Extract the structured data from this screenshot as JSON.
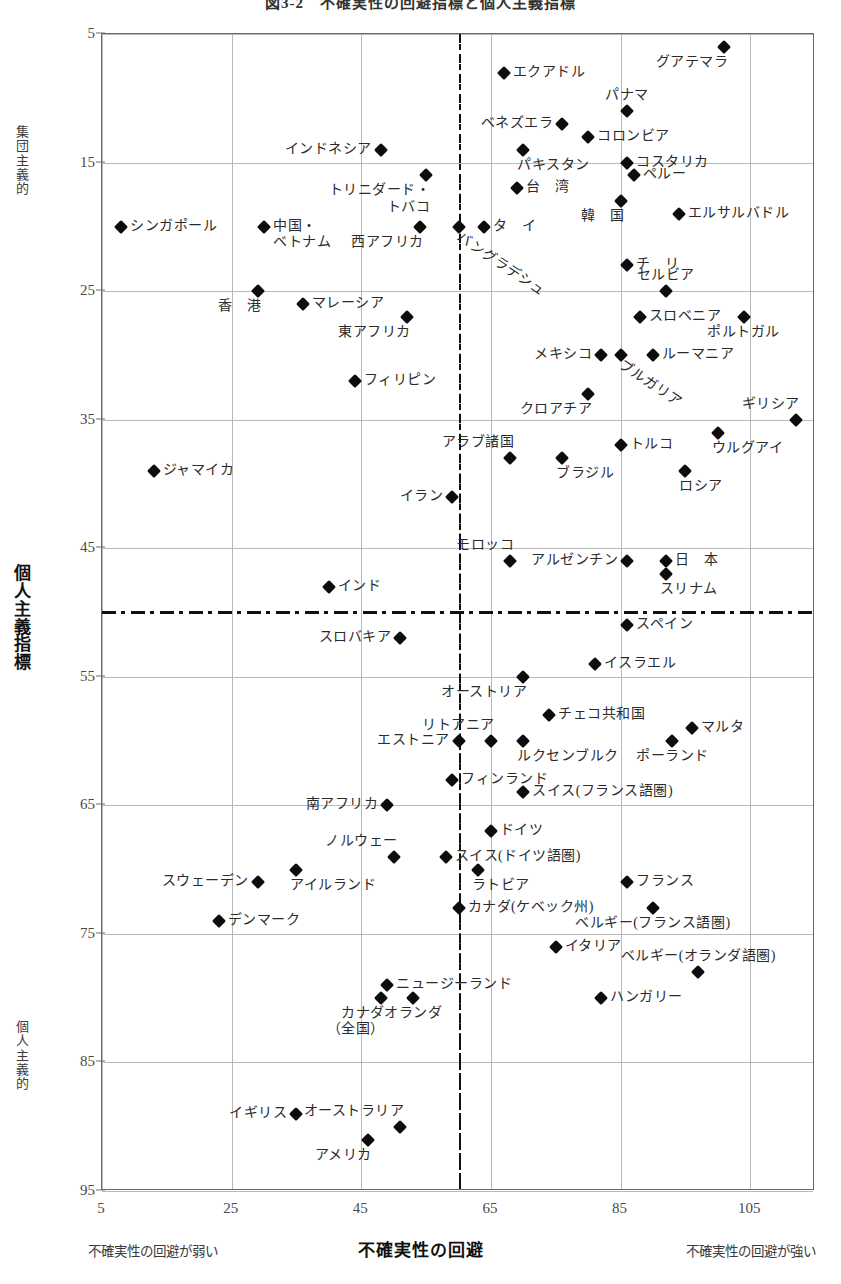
{
  "chart_data": {
    "type": "scatter",
    "title": "図3-2　不確実性の回避指標と個人主義指標",
    "xlabel": "不確実性の回避",
    "ylabel": "個人主義指標",
    "xlim": [
      5,
      115
    ],
    "ylim": [
      5,
      95
    ],
    "y_inverted": true,
    "grid": true,
    "legend": "none",
    "xticks": [
      5,
      25,
      45,
      65,
      85,
      105
    ],
    "yticks": [
      5,
      15,
      25,
      35,
      45,
      55,
      65,
      75,
      85,
      95
    ],
    "x_pole_low": "不確実性の回避が弱い",
    "x_pole_high": "不確実性の回避が強い",
    "y_pole_low": "集団主義的",
    "y_pole_high": "個人主義的",
    "reference_lines": {
      "x": 60,
      "y": 50
    },
    "marker_color": "#0d0d0d",
    "grid_color": "#b9b9b9",
    "frame_color": "#6a6a6a",
    "points": [
      {
        "label": "グアテマラ",
        "x": 101,
        "y": 6,
        "pos": "bl"
      },
      {
        "label": "エクアドル",
        "x": 67,
        "y": 8,
        "pos": "r"
      },
      {
        "label": "パナマ",
        "x": 86,
        "y": 11,
        "pos": "tc"
      },
      {
        "label": "ベネズエラ",
        "x": 76,
        "y": 12,
        "pos": "l"
      },
      {
        "label": "コロンビア",
        "x": 80,
        "y": 13,
        "pos": "r"
      },
      {
        "label": "インドネシア",
        "x": 48,
        "y": 14,
        "pos": "l"
      },
      {
        "label": "パキスタン",
        "x": 70,
        "y": 14,
        "pos": "b"
      },
      {
        "label": "コスタリカ",
        "x": 86,
        "y": 15,
        "pos": "r"
      },
      {
        "label": "ペルー",
        "x": 87,
        "y": 16,
        "pos": "r"
      },
      {
        "label": "トリニダード・\nトバコ",
        "x": 55,
        "y": 16,
        "pos": "bl"
      },
      {
        "label": "台　湾",
        "x": 69,
        "y": 17,
        "pos": "r"
      },
      {
        "label": "韓　国",
        "x": 85,
        "y": 18,
        "pos": "bl"
      },
      {
        "label": "エルサルバドル",
        "x": 94,
        "y": 19,
        "pos": "r"
      },
      {
        "label": "シンガポール",
        "x": 8,
        "y": 20,
        "pos": "r"
      },
      {
        "label": "中国・\nベトナム",
        "x": 30,
        "y": 20,
        "pos": "r"
      },
      {
        "label": "西アフリカ",
        "x": 54,
        "y": 20,
        "pos": "bl"
      },
      {
        "label": "バングラデシュ",
        "x": 60,
        "y": 20,
        "pos": "rot"
      },
      {
        "label": "タ　イ",
        "x": 64,
        "y": 20,
        "pos": "r"
      },
      {
        "label": "チ　リ",
        "x": 86,
        "y": 23,
        "pos": "r"
      },
      {
        "label": "香　港",
        "x": 29,
        "y": 25,
        "pos": "bl"
      },
      {
        "label": "セルビア",
        "x": 92,
        "y": 25,
        "pos": "tc"
      },
      {
        "label": "マレーシア",
        "x": 36,
        "y": 26,
        "pos": "r"
      },
      {
        "label": "スロベニア",
        "x": 88,
        "y": 27,
        "pos": "r"
      },
      {
        "label": "ポルトガル",
        "x": 104,
        "y": 27,
        "pos": "bc"
      },
      {
        "label": "東アフリカ",
        "x": 52,
        "y": 27,
        "pos": "bl"
      },
      {
        "label": "メキシコ",
        "x": 82,
        "y": 30,
        "pos": "l"
      },
      {
        "label": "ブルガリア",
        "x": 85,
        "y": 30,
        "pos": "rot"
      },
      {
        "label": "ルーマニア",
        "x": 90,
        "y": 30,
        "pos": "r"
      },
      {
        "label": "フィリピン",
        "x": 44,
        "y": 32,
        "pos": "r"
      },
      {
        "label": "クロアチア",
        "x": 80,
        "y": 33,
        "pos": "bl"
      },
      {
        "label": "ギリシア",
        "x": 112,
        "y": 35,
        "pos": "tl"
      },
      {
        "label": "トルコ",
        "x": 85,
        "y": 37,
        "pos": "r"
      },
      {
        "label": "ウルグアイ",
        "x": 100,
        "y": 36,
        "pos": "b"
      },
      {
        "label": "アラブ諸国",
        "x": 68,
        "y": 38,
        "pos": "tl"
      },
      {
        "label": "ブラジル",
        "x": 76,
        "y": 38,
        "pos": "b"
      },
      {
        "label": "ロシア",
        "x": 95,
        "y": 39,
        "pos": "b"
      },
      {
        "label": "ジャマイカ",
        "x": 13,
        "y": 39,
        "pos": "r"
      },
      {
        "label": "イラン",
        "x": 59,
        "y": 41,
        "pos": "l"
      },
      {
        "label": "モロッコ",
        "x": 68,
        "y": 46,
        "pos": "tl"
      },
      {
        "label": "アルゼンチン",
        "x": 86,
        "y": 46,
        "pos": "l"
      },
      {
        "label": "日　本",
        "x": 92,
        "y": 46,
        "pos": "r"
      },
      {
        "label": "スリナム",
        "x": 92,
        "y": 47,
        "pos": "b"
      },
      {
        "label": "インド",
        "x": 40,
        "y": 48,
        "pos": "r"
      },
      {
        "label": "スペイン",
        "x": 86,
        "y": 51,
        "pos": "r"
      },
      {
        "label": "スロバキア",
        "x": 51,
        "y": 52,
        "pos": "l"
      },
      {
        "label": "イスラエル",
        "x": 81,
        "y": 54,
        "pos": "r"
      },
      {
        "label": "オーストリア",
        "x": 70,
        "y": 55,
        "pos": "bl"
      },
      {
        "label": "チェコ共和国",
        "x": 74,
        "y": 58,
        "pos": "r"
      },
      {
        "label": "マルタ",
        "x": 96,
        "y": 59,
        "pos": "r"
      },
      {
        "label": "リトアニア",
        "x": 65,
        "y": 60,
        "pos": "tl"
      },
      {
        "label": "エストニア",
        "x": 60,
        "y": 60,
        "pos": "l"
      },
      {
        "label": "ルクセンブルク",
        "x": 70,
        "y": 60,
        "pos": "b"
      },
      {
        "label": "ポーランド",
        "x": 93,
        "y": 60,
        "pos": "bc"
      },
      {
        "label": "フィンランド",
        "x": 59,
        "y": 63,
        "pos": "r"
      },
      {
        "label": "スイス(フランス語圏)",
        "x": 70,
        "y": 64,
        "pos": "r"
      },
      {
        "label": "南アフリカ",
        "x": 49,
        "y": 65,
        "pos": "l"
      },
      {
        "label": "ドイツ",
        "x": 65,
        "y": 67,
        "pos": "r"
      },
      {
        "label": "ノルウェー",
        "x": 50,
        "y": 69,
        "pos": "tl"
      },
      {
        "label": "スイス(ドイツ語圏)",
        "x": 58,
        "y": 69,
        "pos": "r"
      },
      {
        "label": "ラトビア",
        "x": 63,
        "y": 70,
        "pos": "b"
      },
      {
        "label": "スウェーデン",
        "x": 29,
        "y": 71,
        "pos": "l"
      },
      {
        "label": "アイルランド",
        "x": 35,
        "y": 70,
        "pos": "b"
      },
      {
        "label": "フランス",
        "x": 86,
        "y": 71,
        "pos": "r"
      },
      {
        "label": "デンマーク",
        "x": 23,
        "y": 74,
        "pos": "r"
      },
      {
        "label": "カナダ(ケベック州)",
        "x": 60,
        "y": 73,
        "pos": "r"
      },
      {
        "label": "ベルギー(フランス語圏)",
        "x": 90,
        "y": 73,
        "pos": "bc"
      },
      {
        "label": "イタリア",
        "x": 75,
        "y": 76,
        "pos": "r"
      },
      {
        "label": "ベルギー(オランダ語圏)",
        "x": 97,
        "y": 78,
        "pos": "tc"
      },
      {
        "label": "ニュージーランド",
        "x": 49,
        "y": 79,
        "pos": "r"
      },
      {
        "label": "ハンガリー",
        "x": 82,
        "y": 80,
        "pos": "r"
      },
      {
        "label": "カナダ\n（全国）",
        "x": 48,
        "y": 80,
        "pos": "bl"
      },
      {
        "label": "オランダ",
        "x": 53,
        "y": 80,
        "pos": "bc"
      },
      {
        "label": "イギリス",
        "x": 35,
        "y": 89,
        "pos": "l"
      },
      {
        "label": "オーストラリア",
        "x": 51,
        "y": 90,
        "pos": "tl"
      },
      {
        "label": "アメリカ",
        "x": 46,
        "y": 91,
        "pos": "bl"
      }
    ]
  }
}
